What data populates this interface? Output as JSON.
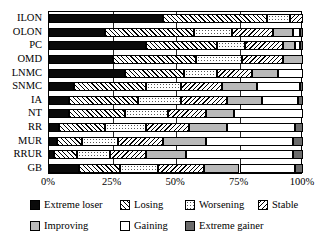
{
  "chart_data": {
    "type": "bar",
    "orientation": "horizontal",
    "stacked": true,
    "normalized": true,
    "title": "",
    "xlabel": "",
    "ylabel": "",
    "xlim": [
      0,
      100
    ],
    "grid": true,
    "legend_position": "bottom",
    "xticks": [
      "0%",
      "25%",
      "50%",
      "75%",
      "100%"
    ],
    "xtick_values": [
      0,
      25,
      50,
      75,
      100
    ],
    "categories": [
      "ILON",
      "OLON",
      "PC",
      "OMD",
      "LNMC",
      "SNMC",
      "IA",
      "NT",
      "RR",
      "MUR",
      "RRUR",
      "GB"
    ],
    "series": [
      {
        "name": "Extreme loser",
        "key": "extreme-loser",
        "color": "#0a0a0a",
        "pattern": "solid-black",
        "values": [
          45,
          22,
          38,
          25,
          30,
          10,
          8,
          8,
          4,
          3,
          2,
          12
        ]
      },
      {
        "name": "Losing",
        "key": "losing",
        "color": "#ffffff",
        "pattern": "diagonal-hatch-right",
        "values": [
          41,
          35,
          28,
          33,
          23,
          28,
          27,
          22,
          18,
          10,
          9,
          16
        ]
      },
      {
        "name": "Worsening",
        "key": "worsening",
        "color": "#ffffff",
        "pattern": "dotted",
        "values": [
          9,
          15,
          11,
          18,
          13,
          14,
          17,
          17,
          16,
          14,
          13,
          15
        ]
      },
      {
        "name": "Stable",
        "key": "stable",
        "color": "#ffffff",
        "pattern": "diagonal-hatch-left",
        "values": [
          5,
          16,
          15,
          16,
          14,
          16,
          18,
          15,
          17,
          18,
          14,
          18
        ]
      },
      {
        "name": "Improving",
        "key": "improving",
        "color": "#b9b9b9",
        "pattern": "solid-light-gray",
        "values": [
          0,
          8,
          5,
          8,
          10,
          14,
          14,
          11,
          15,
          17,
          16,
          14
        ]
      },
      {
        "name": "Gaining",
        "key": "gaining",
        "color": "#ffffff",
        "pattern": "solid-white",
        "values": [
          0,
          3,
          2,
          0,
          10,
          17,
          14,
          27,
          27,
          34,
          42,
          22
        ]
      },
      {
        "name": "Extreme gainer",
        "key": "extreme-gainer",
        "color": "#6b6b6b",
        "pattern": "solid-dark-gray",
        "values": [
          0,
          1,
          1,
          0,
          0,
          1,
          2,
          0,
          3,
          4,
          4,
          3
        ]
      }
    ]
  },
  "legend": {
    "items": [
      {
        "label": "Extreme loser",
        "key": "extreme-loser"
      },
      {
        "label": "Losing",
        "key": "losing"
      },
      {
        "label": "Worsening",
        "key": "worsening"
      },
      {
        "label": "Stable",
        "key": "stable"
      },
      {
        "label": "Improving",
        "key": "improving"
      },
      {
        "label": "Gaining",
        "key": "gaining"
      },
      {
        "label": "Extreme gainer",
        "key": "extreme-gainer"
      }
    ]
  }
}
